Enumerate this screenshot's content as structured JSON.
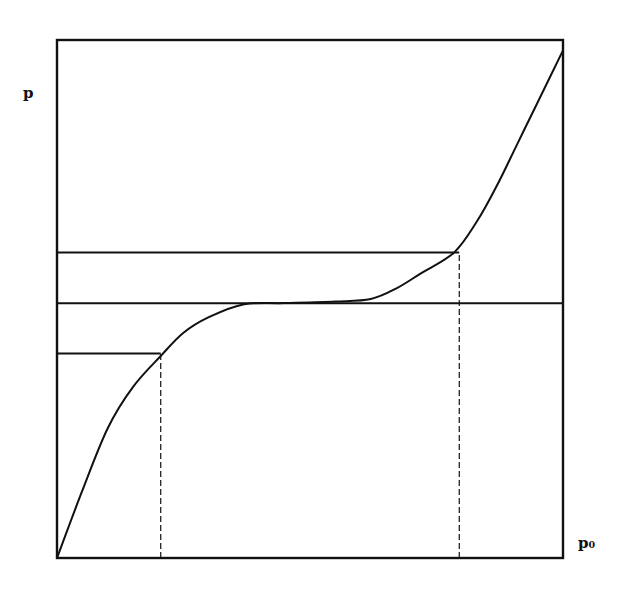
{
  "chart_data": {
    "type": "line",
    "title": "",
    "xlabel": "p₀",
    "ylabel": "p",
    "grid": false,
    "legend": null,
    "xlim": [
      0,
      1
    ],
    "ylim": [
      0,
      1
    ],
    "series": [
      {
        "name": "p(p0) curve",
        "x": [
          0.0,
          0.05,
          0.1,
          0.15,
          0.205,
          0.25,
          0.3,
          0.37,
          0.45,
          0.55,
          0.62,
          0.67,
          0.72,
          0.785,
          0.83,
          0.87,
          0.91,
          0.95,
          1.0
        ],
        "y": [
          0.0,
          0.13,
          0.25,
          0.33,
          0.39,
          0.435,
          0.465,
          0.49,
          0.492,
          0.495,
          0.5,
          0.52,
          0.55,
          0.59,
          0.65,
          0.72,
          0.8,
          0.88,
          0.98
        ]
      }
    ],
    "reference_lines": [
      {
        "type": "horizontal",
        "y": 0.492,
        "x_from": 0.0,
        "x_to": 1.0,
        "style": "solid",
        "label": "fixed point level"
      },
      {
        "type": "horizontal",
        "y": 0.59,
        "x_from": 0.0,
        "x_to": 0.795,
        "style": "solid"
      },
      {
        "type": "horizontal",
        "y": 0.395,
        "x_from": 0.0,
        "x_to": 0.205,
        "style": "solid"
      },
      {
        "type": "vertical",
        "x": 0.205,
        "y_from": 0.0,
        "y_to": 0.395,
        "style": "dashed"
      },
      {
        "type": "vertical",
        "x": 0.795,
        "y_from": 0.0,
        "y_to": 0.59,
        "style": "dashed"
      }
    ],
    "annotations": []
  },
  "labels": {
    "y_axis": "p",
    "x_axis": "p₀"
  },
  "style": {
    "ink": "#111111",
    "background": "#ffffff"
  }
}
